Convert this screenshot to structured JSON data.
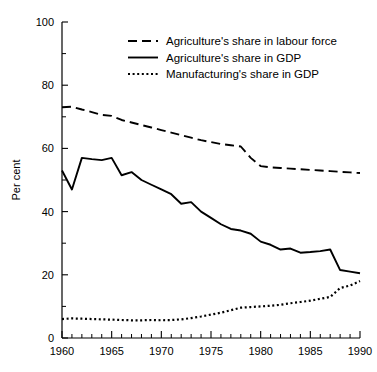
{
  "chart_data": {
    "type": "line",
    "title": "",
    "xlabel": "",
    "ylabel": "Per cent",
    "xlim": [
      1960,
      1990
    ],
    "ylim": [
      0,
      100
    ],
    "ytick_values": [
      0,
      20,
      40,
      60,
      80,
      100
    ],
    "ytick_labels": [
      "0",
      "20",
      "40",
      "60",
      "80",
      "100"
    ],
    "yminor_step": 10,
    "xtick_values": [
      1960,
      1965,
      1970,
      1975,
      1980,
      1985,
      1990
    ],
    "xtick_labels": [
      "1960",
      "1965",
      "1970",
      "1975",
      "1980",
      "1985",
      "1990"
    ],
    "xminor_step": 1,
    "grid": false,
    "legend_position": "top-center",
    "x": [
      1960,
      1961,
      1962,
      1963,
      1964,
      1965,
      1966,
      1967,
      1968,
      1969,
      1970,
      1971,
      1972,
      1973,
      1974,
      1975,
      1976,
      1977,
      1978,
      1979,
      1980,
      1981,
      1982,
      1983,
      1984,
      1985,
      1986,
      1987,
      1988,
      1989,
      1990
    ],
    "series": [
      {
        "name": "Agriculture's share in labour force",
        "style": "dashed",
        "values": [
          73.0,
          73.2,
          72.3,
          71.5,
          70.6,
          70.3,
          69.0,
          68.2,
          67.4,
          66.6,
          65.8,
          65.0,
          64.2,
          63.4,
          62.6,
          62.0,
          61.4,
          61.0,
          60.6,
          57.0,
          54.4,
          54.0,
          53.8,
          53.6,
          53.4,
          53.2,
          53.0,
          52.8,
          52.6,
          52.4,
          52.2
        ]
      },
      {
        "name": "Agriculture's share in GDP",
        "style": "solid",
        "values": [
          53.0,
          47.0,
          57.0,
          56.6,
          56.3,
          57.0,
          51.5,
          52.5,
          50.0,
          48.5,
          47.0,
          45.5,
          42.5,
          43.0,
          40.0,
          38.0,
          36.0,
          34.5,
          34.0,
          33.0,
          30.5,
          29.5,
          28.0,
          28.3,
          27.0,
          27.2,
          27.5,
          28.0,
          21.5,
          21.0,
          20.5
        ]
      },
      {
        "name": "Manufacturing's share in GDP",
        "style": "dotted",
        "values": [
          6.0,
          6.2,
          6.1,
          6.0,
          5.9,
          5.8,
          5.7,
          5.6,
          5.6,
          5.7,
          5.6,
          5.7,
          5.9,
          6.3,
          6.8,
          7.4,
          8.0,
          8.8,
          9.6,
          9.8,
          10.0,
          10.2,
          10.5,
          11.0,
          11.4,
          11.8,
          12.4,
          13.0,
          15.8,
          16.6,
          18.0
        ]
      }
    ]
  },
  "legend": {
    "items": [
      {
        "label": "Agriculture's share in labour force",
        "style": "dashed"
      },
      {
        "label": "Agriculture's share in GDP",
        "style": "solid"
      },
      {
        "label": "Manufacturing's share in GDP",
        "style": "dotted"
      }
    ]
  }
}
